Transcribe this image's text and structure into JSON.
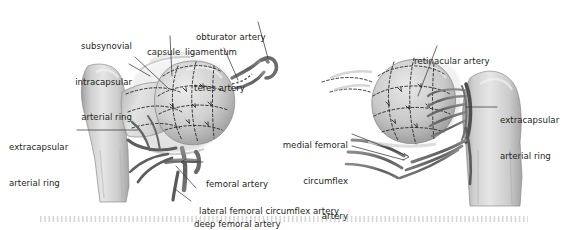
{
  "figure": {
    "type": "medical-anatomy-illustration",
    "style": "grayscale-halftone",
    "colors": {
      "background": "#ffffff",
      "text": "#231f20",
      "leader_line": "#3a3a3a",
      "bone_light": "#e2e2e2",
      "bone_mid": "#c9c9c9",
      "bone_shadow": "#9a9a9a",
      "vessel": "#6d6d6d",
      "vessel_dark": "#4a4a4a",
      "capsule": "#dcdcdc",
      "dashed_ring": "#2b2b2b",
      "footer_ribbon": "#d0d0d0"
    }
  },
  "panels": [
    {
      "id": "left-panel",
      "name": "anterior-view",
      "labels": [
        "subsynovial-intracapsular-arterial-ring",
        "capsule",
        "ligamentum-teres-artery",
        "obturator-artery",
        "extracapsular-arterial-ring-left",
        "femoral-artery",
        "lateral-femoral-circumflex-artery",
        "deep-femoral-artery"
      ]
    },
    {
      "id": "right-panel",
      "name": "posterior-view",
      "labels": [
        "retinacular-artery",
        "extracapsular-arterial-ring-right",
        "medial-femoral-circumflex-artery"
      ]
    }
  ],
  "labels": {
    "subsynovial_line1": "subsynovial",
    "subsynovial_line2": "intracapsular",
    "subsynovial_line3": "arterial ring",
    "capsule": "capsule",
    "ligamentum_line1": "ligamentum",
    "ligamentum_line2": "teres artery",
    "obturator_artery": "obturator artery",
    "extracapsular_left_line1": "extracapsular",
    "extracapsular_left_line2": "arterial ring",
    "femoral_artery": "femoral artery",
    "lateral_femoral_circumflex": "lateral femoral circumflex artery",
    "deep_femoral_artery": "deep femoral artery",
    "retinacular_artery": "retinacular artery",
    "extracapsular_right_line1": "extracapsular",
    "extracapsular_right_line2": "arterial ring",
    "medial_circumflex_line1": "medial femoral",
    "medial_circumflex_line2": "circumflex",
    "medial_circumflex_line3": "artery"
  }
}
